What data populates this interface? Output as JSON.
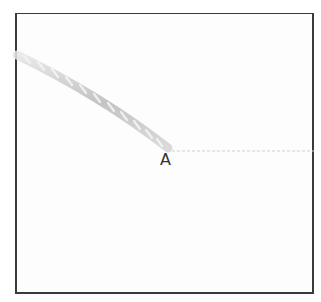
{
  "diagram": {
    "point_label": "A",
    "rope": {
      "description": "twisted rope/wire ending at point A",
      "color": "#b5b5b5",
      "highlight": "#e2e2e2"
    },
    "extension_line": {
      "style": "dashed",
      "color": "#cfcfcf"
    },
    "frame_color": "#3a3a3a"
  }
}
